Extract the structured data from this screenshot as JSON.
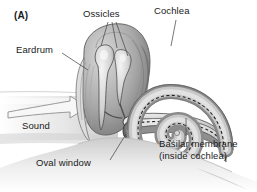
{
  "figure": {
    "panel_label": "(A)",
    "background_color": "#ffffff",
    "width": 257,
    "height": 192
  },
  "labels": {
    "panel": "(A)",
    "ossicles": "Ossicles",
    "cochlea": "Cochlea",
    "eardrum": "Eardrum",
    "sound": "Sound",
    "oval_window": "Oval window",
    "basilar_membrane_line1": "Basilar membrane",
    "basilar_membrane_line2": "(inside cochlea)"
  },
  "colors": {
    "text": "#1a1a1a",
    "leader_line": "#4a4a4a",
    "tissue_light": "#e8e8e8",
    "tissue_mid": "#b5b5b5",
    "tissue_dark": "#7d7d7d",
    "tissue_darkest": "#565656",
    "outline": "#5a5a5a",
    "membrane_dash": "#2e2e2e",
    "canal_shade": "#cfcfcf"
  },
  "structures": [
    {
      "name": "ear-canal",
      "label_ref": "sound"
    },
    {
      "name": "eardrum-tympanic-membrane",
      "label_ref": "eardrum"
    },
    {
      "name": "ossicles-malleus-incus-stapes",
      "label_ref": "ossicles"
    },
    {
      "name": "oval-window",
      "label_ref": "oval_window"
    },
    {
      "name": "cochlea-spiral",
      "label_ref": "cochlea"
    },
    {
      "name": "basilar-membrane",
      "label_ref": "basilar_membrane_line1"
    },
    {
      "name": "sound-arrow",
      "label_ref": "sound"
    }
  ]
}
